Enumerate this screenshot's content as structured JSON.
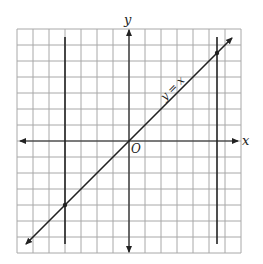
{
  "figure": {
    "axes": {
      "x_label": "x",
      "y_label": "y",
      "origin_label": "O"
    },
    "grid": {
      "x_min": -7,
      "x_max": 7,
      "y_min": -7,
      "y_max": 7,
      "step": 1
    },
    "line_label": "y = x",
    "vertical_lines": [
      {
        "name": "left-vertical-line",
        "x": -4
      },
      {
        "name": "right-vertical-line",
        "x": 5.5
      }
    ],
    "intersection_points": [
      {
        "x": -4,
        "y": -4
      },
      {
        "x": 5.5,
        "y": 5.5
      }
    ],
    "colors": {
      "grid": "#a8a8a8",
      "lines": "#222222",
      "background": "#ffffff"
    }
  }
}
